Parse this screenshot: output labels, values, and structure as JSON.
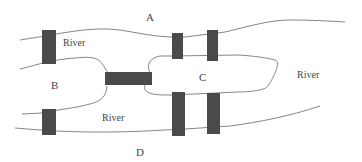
{
  "diagram": {
    "regions": [
      {
        "id": "A",
        "label": "A"
      },
      {
        "id": "B",
        "label": "B"
      },
      {
        "id": "C",
        "label": "C"
      },
      {
        "id": "D",
        "label": "D"
      }
    ],
    "river_labels": [
      "River",
      "River",
      "River"
    ],
    "bridge_count": 7,
    "colors": {
      "line": "#777777",
      "bridge": "#4a4a4a",
      "text": "#444444"
    }
  }
}
